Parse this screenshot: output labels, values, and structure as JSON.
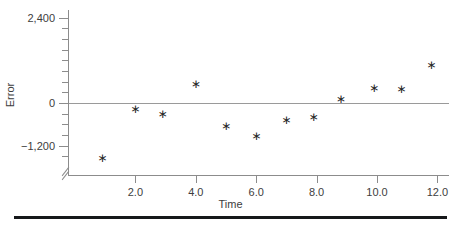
{
  "chart_data": {
    "type": "scatter",
    "title": "",
    "xlabel": "Time",
    "ylabel": "Error",
    "grid": false,
    "legend": false,
    "marker": "asterisk",
    "xlim": [
      0.0,
      12.6
    ],
    "ylim": [
      -1800,
      3000
    ],
    "xticks": [
      2.0,
      4.0,
      6.0,
      8.0,
      10.0,
      12.0
    ],
    "xtick_labels": [
      "2.0",
      "4.0",
      "6.0",
      "8.0",
      "10.0",
      "12.0"
    ],
    "yticks": [
      2400,
      0,
      -1200
    ],
    "ytick_labels": [
      "2,400",
      "0",
      "−1,200"
    ],
    "y_minor_tick_interval": 300,
    "zero_reference_line": 0,
    "axis_break": true,
    "x": [
      0.9,
      2.0,
      2.9,
      4.0,
      5.0,
      6.0,
      7.0,
      7.9,
      8.8,
      9.9,
      10.8,
      11.8
    ],
    "values": [
      -1550,
      -180,
      -320,
      540,
      -640,
      -930,
      -470,
      -400,
      110,
      420,
      400,
      1070
    ],
    "points": [
      {
        "x": 0.9,
        "y": -1550
      },
      {
        "x": 2.0,
        "y": -180
      },
      {
        "x": 2.9,
        "y": -320
      },
      {
        "x": 4.0,
        "y": 540
      },
      {
        "x": 5.0,
        "y": -640
      },
      {
        "x": 6.0,
        "y": -930
      },
      {
        "x": 7.0,
        "y": -470
      },
      {
        "x": 7.9,
        "y": -400
      },
      {
        "x": 8.8,
        "y": 110
      },
      {
        "x": 9.9,
        "y": 420
      },
      {
        "x": 10.8,
        "y": 400
      },
      {
        "x": 11.8,
        "y": 1070
      }
    ],
    "marker_glyph": "∗",
    "colors": {
      "marker": "#262626",
      "axis": "#8c8c8c",
      "zero_line": "#9a9a9a",
      "text": "#3d3d3d",
      "rule": "#16181a",
      "background": "#ffffff"
    }
  }
}
